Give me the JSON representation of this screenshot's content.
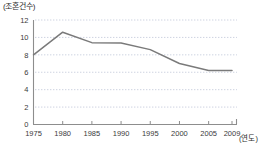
{
  "chart_data": {
    "type": "line",
    "title": "",
    "ylabel": "(조혼건수)",
    "xlabel": "(연도)",
    "x": [
      1975,
      1980,
      1985,
      1990,
      1995,
      2000,
      2005,
      2009
    ],
    "xticklabels": [
      "1975",
      "1980",
      "1985",
      "1990",
      "1995",
      "2000",
      "2005",
      "2009"
    ],
    "yticklabels": [
      "0",
      "2",
      "4",
      "6",
      "8",
      "10",
      "12"
    ],
    "yticks": [
      0,
      2,
      4,
      6,
      8,
      10,
      12
    ],
    "ylim": [
      0,
      12
    ],
    "xlim": [
      1975,
      2009
    ],
    "grid": "horizontal-dotted",
    "legend": "none",
    "series": [
      {
        "name": "조혼건수",
        "color": "#7a7a7a",
        "points": [
          {
            "x": 1975,
            "y": 8.0
          },
          {
            "x": 1980,
            "y": 10.6
          },
          {
            "x": 1985,
            "y": 9.4
          },
          {
            "x": 1990,
            "y": 9.35
          },
          {
            "x": 1995,
            "y": 8.6
          },
          {
            "x": 2000,
            "y": 7.0
          },
          {
            "x": 2005,
            "y": 6.2
          },
          {
            "x": 2009,
            "y": 6.2
          }
        ],
        "values": [
          8.0,
          10.6,
          9.4,
          9.35,
          8.6,
          7.0,
          6.2,
          6.2
        ]
      }
    ]
  }
}
